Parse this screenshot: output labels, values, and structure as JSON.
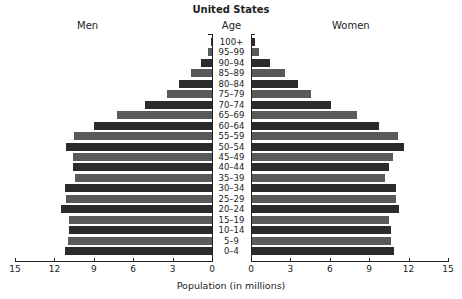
{
  "chart_data": {
    "type": "bar",
    "orientation": "horizontal",
    "subtype": "population-pyramid",
    "title": "United States",
    "xlabel": "Population (in millions)",
    "ylabel": "Age",
    "left_label": "Men",
    "right_label": "Women",
    "categories": [
      "100+",
      "95–99",
      "90–94",
      "85–89",
      "80–84",
      "75–79",
      "70–74",
      "65–69",
      "60–64",
      "55–59",
      "50–54",
      "45–49",
      "40–44",
      "35–39",
      "30–34",
      "25–29",
      "20–24",
      "15–19",
      "10–14",
      "5–9",
      "0–4"
    ],
    "series": [
      {
        "name": "Men",
        "values": [
          0.05,
          0.3,
          0.8,
          1.6,
          2.5,
          3.4,
          5.1,
          7.2,
          9.0,
          10.5,
          11.1,
          10.6,
          10.6,
          10.4,
          11.2,
          11.1,
          11.5,
          10.9,
          10.9,
          11.0,
          11.2
        ]
      },
      {
        "name": "Women",
        "values": [
          0.2,
          0.5,
          1.4,
          2.5,
          3.5,
          4.5,
          6.0,
          8.0,
          9.7,
          11.1,
          11.6,
          10.7,
          10.4,
          10.1,
          11.0,
          11.0,
          11.2,
          10.4,
          10.6,
          10.6,
          10.8
        ]
      }
    ],
    "xlim": [
      0,
      15
    ],
    "xticks": [
      "0",
      "3",
      "6",
      "9",
      "12",
      "15"
    ],
    "grid": false,
    "colors": {
      "dark": "#2b2b2b",
      "light": "#5a5a5a"
    }
  }
}
